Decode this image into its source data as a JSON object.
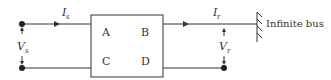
{
  "diagram": {
    "network": {
      "params": [
        "A",
        "B",
        "C",
        "D"
      ]
    },
    "sending_current": {
      "symbol": "I",
      "subscript": "s"
    },
    "receiving_current": {
      "symbol": "I",
      "subscript": "r"
    },
    "sending_voltage": {
      "symbol": "V",
      "subscript": "s"
    },
    "receiving_voltage": {
      "symbol": "V",
      "subscript": "r"
    },
    "bus_label": "Infinite bus"
  }
}
